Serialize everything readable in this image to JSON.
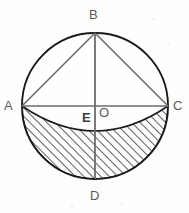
{
  "figure": {
    "background_color": "#fefefe",
    "stroke_color": "#1a1a1a",
    "chord_color": "#6b6b6b",
    "label_color": "#5a5a5a",
    "hatch_color": "#2b2b2b"
  },
  "labels": {
    "a": "A",
    "b": "B",
    "c": "C",
    "d": "D",
    "e": "E",
    "o": "O"
  },
  "geometry": {
    "circle": {
      "cx": 95,
      "cy": 106,
      "r": 73
    },
    "points": {
      "A": {
        "x": 22,
        "y": 106
      },
      "B": {
        "x": 95,
        "y": 33
      },
      "C": {
        "x": 168,
        "y": 106
      },
      "D": {
        "x": 95,
        "y": 179
      },
      "E": {
        "x": 95,
        "y": 126
      },
      "O": {
        "x": 95,
        "y": 106
      }
    },
    "segments": [
      {
        "name": "diameter-AC",
        "from": "A",
        "to": "C"
      },
      {
        "name": "diameter-BD",
        "from": "B",
        "to": "D"
      },
      {
        "name": "chord-BA",
        "from": "B",
        "to": "A"
      },
      {
        "name": "chord-BC",
        "from": "B",
        "to": "C"
      }
    ],
    "shaded_region": {
      "name": "hatched-segment",
      "upper_arc_sag": 30,
      "hatch_angle_deg": 45,
      "hatch_spacing": 6
    }
  },
  "label_positions": {
    "A": {
      "left": 4,
      "top": 99
    },
    "B": {
      "left": 89,
      "top": 8
    },
    "C": {
      "left": 173,
      "top": 99
    },
    "D": {
      "left": 90,
      "top": 189
    },
    "E": {
      "left": 82,
      "top": 111
    },
    "O": {
      "left": 99,
      "top": 106
    }
  }
}
